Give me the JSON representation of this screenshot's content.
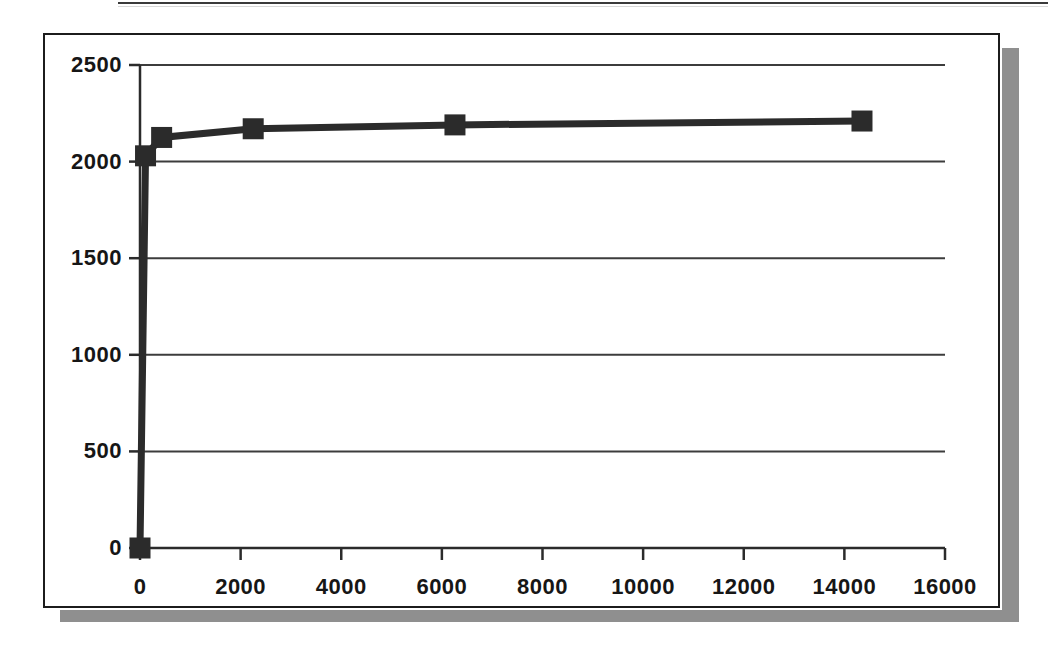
{
  "figure": {
    "background_color": "#ffffff",
    "frame_border_color": "#1c1c1c",
    "shadow_color": "#8f8f8f",
    "series_color": "#2b2b2b",
    "grid_color": "#3c3c3c",
    "axis_color": "#2b2b2b"
  },
  "chart_data": {
    "type": "line",
    "title": "",
    "subtitle": "",
    "xlabel": "",
    "ylabel": "",
    "xlim": [
      0,
      16000
    ],
    "ylim": [
      0,
      2500
    ],
    "grid": true,
    "grid_axis": "y",
    "legend": false,
    "legend_position": "none",
    "marker": "square",
    "xticks": [
      0,
      2000,
      4000,
      6000,
      8000,
      10000,
      12000,
      14000,
      16000
    ],
    "xtick_labels": [
      "0",
      "2000",
      "4000",
      "6000",
      "8000",
      "10000",
      "12000",
      "14000",
      "16000"
    ],
    "yticks": [
      0,
      500,
      1000,
      1500,
      2000,
      2500
    ],
    "ytick_labels": [
      "0",
      "500",
      "1000",
      "1500",
      "2000",
      "2500"
    ],
    "series": [
      {
        "name": "series-1",
        "x": [
          0,
          110,
          430,
          2250,
          6260,
          14350
        ],
        "y": [
          0,
          2030,
          2125,
          2170,
          2190,
          2210
        ]
      }
    ]
  }
}
